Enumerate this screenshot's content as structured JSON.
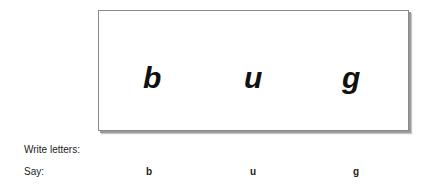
{
  "card": {
    "letters": [
      "b",
      "u",
      "g"
    ]
  },
  "write_row": {
    "label": "Write letters:"
  },
  "say_row": {
    "label": "Say:",
    "letters": [
      "b",
      "u",
      "g"
    ]
  }
}
